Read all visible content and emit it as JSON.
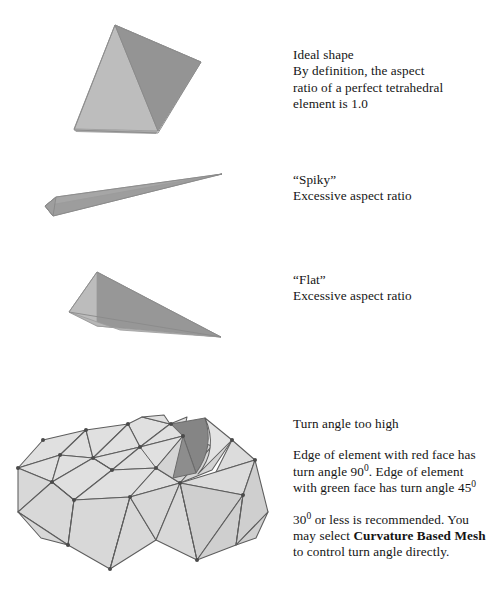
{
  "figure": {
    "background_color": "#ffffff",
    "text_color": "#141414",
    "shape_colors": {
      "face_light": "#bdbdbd",
      "face_mid": "#ababab",
      "face_dark": "#949494",
      "mesh_fill": "#dcdcdc",
      "mesh_fill_alt": "#d2d2d2",
      "mesh_edge": "#595959",
      "highlight_face_dark": "#8a8a8a",
      "highlight_face_mid": "#a0a0a0"
    }
  },
  "captions": {
    "ideal": {
      "lines": [
        "Ideal shape",
        "By definition, the aspect",
        "ratio of a perfect tetrahedral",
        "element is 1.0"
      ]
    },
    "spiky": {
      "lines": [
        "“Spiky”",
        "Excessive aspect ratio"
      ]
    },
    "flat": {
      "lines": [
        "“Flat”",
        "Excessive aspect ratio"
      ]
    },
    "turn_angle": {
      "heading": "Turn angle too high",
      "para1_part1": "Edge of element with red face has",
      "para1_part2": "turn angle 90",
      "para1_sup1": "0",
      "para1_part3": ". Edge of element",
      "para1_part4": "with green face has turn angle 45",
      "para1_sup2": "0",
      "para2_part1": "30",
      "para2_sup1": "0",
      "para2_part2": " or less is recommended.",
      "para2_part3": "You may select ",
      "para2_bold1": "Curvature Based",
      "para2_bold2": "Mesh",
      "para2_part4": " to control turn angle",
      "para2_part5": "directly."
    }
  },
  "shapes": {
    "ideal_tetra": {
      "label": "ideal-tetrahedron",
      "aspect_ratio": "1.0",
      "apex": [
        115,
        25
      ],
      "left_base": [
        74,
        129
      ],
      "front_base": [
        158,
        131
      ],
      "right_base": [
        201,
        62
      ]
    },
    "spiky_tetra": {
      "label": "spiky-tetrahedron",
      "tip": [
        222,
        174
      ],
      "base_top": [
        56,
        197
      ],
      "base_left": [
        45,
        206
      ],
      "base_bottom": [
        53,
        215
      ]
    },
    "flat_tetra": {
      "label": "flat-tetrahedron",
      "apex": [
        97,
        272
      ],
      "left": [
        69,
        312
      ],
      "front": [
        97,
        326
      ],
      "tip": [
        221,
        337
      ]
    },
    "mesh_block": {
      "label": "meshed-block-with-notch",
      "red_face_turn_angle": "90",
      "green_face_turn_angle": "45"
    }
  }
}
